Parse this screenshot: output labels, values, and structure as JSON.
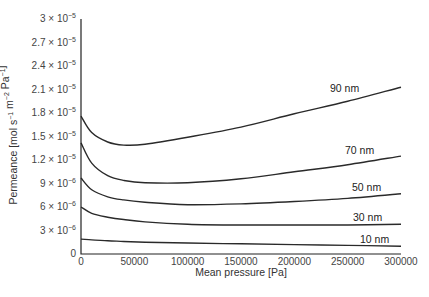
{
  "chart_data": {
    "type": "line",
    "title": "",
    "xlabel": "Mean pressure [Pa]",
    "ylabel": "Permeance [mol s^-1 m^-2 Pa^-1]",
    "xlim": [
      0,
      300000
    ],
    "ylim": [
      0,
      3e-05
    ],
    "grid": false,
    "legend": "inline labels at right end of curves",
    "x_ticks": [
      0,
      50000,
      100000,
      150000,
      200000,
      250000,
      300000
    ],
    "x_tick_labels": [
      "0",
      "50000",
      "100000",
      "150000",
      "200000",
      "250000",
      "300000"
    ],
    "y_ticks": [
      0,
      3e-06,
      6e-06,
      9e-06,
      1.2e-05,
      1.5e-05,
      1.8e-05,
      2.1e-05,
      2.4e-05,
      2.7e-05,
      3e-05
    ],
    "y_tick_labels": [
      {
        "mant": "0",
        "exp": ""
      },
      {
        "mant": "3 × 10",
        "exp": "−6"
      },
      {
        "mant": "6 × 10",
        "exp": "−6"
      },
      {
        "mant": "9 × 10",
        "exp": "−6"
      },
      {
        "mant": "1.2 × 10",
        "exp": "−5"
      },
      {
        "mant": "1.5 × 10",
        "exp": "−5"
      },
      {
        "mant": "1.8 × 10",
        "exp": "−5"
      },
      {
        "mant": "2.1 × 10",
        "exp": "−5"
      },
      {
        "mant": "2.4 × 10",
        "exp": "−5"
      },
      {
        "mant": "2.7 × 10",
        "exp": "−5"
      },
      {
        "mant": "3 × 10",
        "exp": "−5"
      }
    ],
    "x": [
      0,
      10000,
      25000,
      40000,
      60000,
      100000,
      150000,
      200000,
      250000,
      300000
    ],
    "series": [
      {
        "name": "90 nm",
        "values": [
          1.76e-05,
          1.55e-05,
          1.43e-05,
          1.39e-05,
          1.4e-05,
          1.49e-05,
          1.62e-05,
          1.79e-05,
          1.95e-05,
          2.13e-05
        ],
        "label_pos": [
          330,
          92
        ]
      },
      {
        "name": "70 nm",
        "values": [
          1.42e-05,
          1.16e-05,
          1e-05,
          9.4e-06,
          9.1e-06,
          9.1e-06,
          9.6e-06,
          1.05e-05,
          1.14e-05,
          1.25e-05
        ],
        "label_pos": [
          345,
          154
        ]
      },
      {
        "name": "50 nm",
        "values": [
          9.7e-06,
          8.2e-06,
          7.3e-06,
          6.9e-06,
          6.6e-06,
          6.3e-06,
          6.4e-06,
          6.7e-06,
          7.1e-06,
          7.7e-06
        ],
        "label_pos": [
          352,
          191
        ]
      },
      {
        "name": "30 nm",
        "values": [
          6e-06,
          5.2e-06,
          4.7e-06,
          4.4e-06,
          4.1e-06,
          3.8e-06,
          3.7e-06,
          3.7e-06,
          3.7e-06,
          3.8e-06
        ],
        "label_pos": [
          353,
          221
        ]
      },
      {
        "name": "10 nm",
        "values": [
          1.9e-06,
          1.8e-06,
          1.7e-06,
          1.6e-06,
          1.5e-06,
          1.4e-06,
          1.3e-06,
          1.2e-06,
          1.1e-06,
          1e-06
        ],
        "label_pos": [
          360,
          243
        ]
      }
    ]
  },
  "axes": {
    "xlabel": "Mean pressure [Pa]",
    "ylabel_main": "Permeance [mol s",
    "ylabel_parts": [
      {
        "t": "Permeance [mol s",
        "sup": "−1"
      },
      {
        "t": " m",
        "sup": "−2"
      },
      {
        "t": " Pa",
        "sup": "−1"
      },
      {
        "t": "]",
        "sup": ""
      }
    ]
  }
}
